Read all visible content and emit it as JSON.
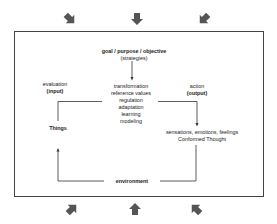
{
  "diagram": {
    "top": {
      "title": "goal / purpose / objective",
      "subtitle": "(strategies)"
    },
    "center": {
      "items": [
        "transformation",
        "reference values",
        "regulation",
        "adaptation",
        "learning",
        "modeling"
      ]
    },
    "left": {
      "label": "evaluation",
      "sublabel": "(input)",
      "node": "Things"
    },
    "right": {
      "label": "action",
      "sublabel": "(output)",
      "node_line1": "sensations, emotions, feelings",
      "node_line2": "Conformed Thought"
    },
    "bottom": {
      "label": "environment"
    },
    "external_arrows": {
      "top": [
        "down-right",
        "down",
        "down-left"
      ],
      "bottom": [
        "up-right",
        "up",
        "up-left"
      ],
      "color": "#555555"
    },
    "colors": {
      "frame": "#444444",
      "lines": "#333333",
      "text": "#1a1a1a"
    }
  }
}
